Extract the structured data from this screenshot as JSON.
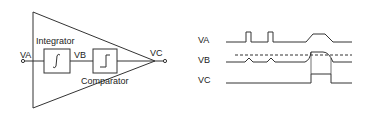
{
  "block_diagram": {
    "input_label": "VA",
    "mid_label": "VB",
    "output_label": "VC",
    "integrator_label": "Integrator",
    "comparator_label": "Comparator",
    "integrator_symbol": "∫",
    "comparator_symbol": "step"
  },
  "timing_diagram": {
    "signals": [
      {
        "name": "VA",
        "description": "two short pulses, then a wide trapezoidal pulse"
      },
      {
        "name": "VB",
        "description": "small bumps, then a ramp crossing the dashed threshold"
      },
      {
        "name": "VC",
        "description": "low, then a single high pulse while VB exceeds threshold"
      }
    ],
    "threshold_line": "dashed"
  },
  "colors": {
    "line": "#333333",
    "background": "#ffffff"
  }
}
